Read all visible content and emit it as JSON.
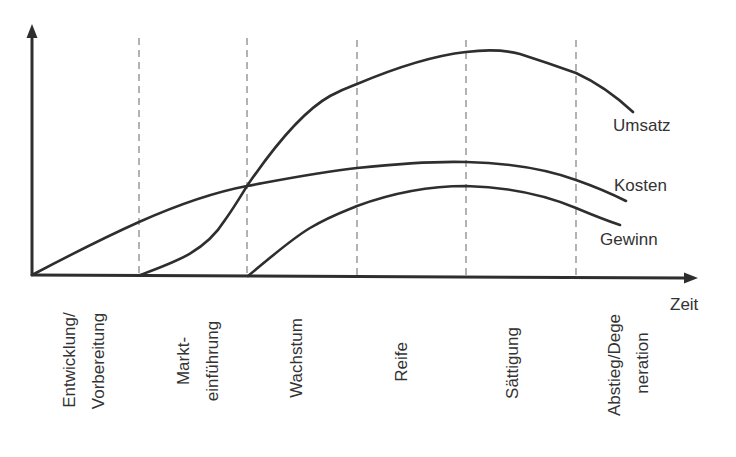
{
  "diagram": {
    "type": "product-life-cycle",
    "x_axis_label": "Zeit",
    "series": [
      {
        "key": "umsatz",
        "label": "Umsatz"
      },
      {
        "key": "kosten",
        "label": "Kosten"
      },
      {
        "key": "gewinn",
        "label": "Gewinn"
      }
    ],
    "phases": [
      {
        "key": "entwicklung",
        "lines": [
          "Entwicklung/",
          "Vorbereitung"
        ]
      },
      {
        "key": "markteinfuehrung",
        "lines": [
          "Markt-",
          "einführung"
        ]
      },
      {
        "key": "wachstum",
        "lines": [
          "Wachstum"
        ]
      },
      {
        "key": "reife",
        "lines": [
          "Reife"
        ]
      },
      {
        "key": "saettigung",
        "lines": [
          "Sättigung"
        ]
      },
      {
        "key": "abstieg",
        "lines": [
          "Abstieg/Dege",
          "neration"
        ]
      }
    ],
    "colors": {
      "line": "#2e2e2e",
      "divider": "#8a8a8a",
      "text": "#333333",
      "background": "#ffffff"
    }
  }
}
